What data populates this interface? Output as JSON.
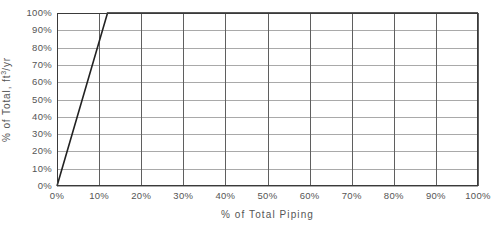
{
  "chart_data": {
    "type": "line",
    "title": "",
    "xlabel": "% of Total Piping",
    "ylabel_prefix": "% of Total, ft",
    "ylabel_superscript": "3",
    "ylabel_suffix": "/yr",
    "ylabel_plain": "% of Total, ft3/yr",
    "xlim": [
      0,
      100
    ],
    "ylim": [
      0,
      100
    ],
    "grid": true,
    "legend": "none",
    "x_tick_labels": [
      "0%",
      "10%",
      "20%",
      "30%",
      "40%",
      "50%",
      "60%",
      "70%",
      "80%",
      "90%",
      "100%"
    ],
    "x_tick_values": [
      0,
      10,
      20,
      30,
      40,
      50,
      60,
      70,
      80,
      90,
      100
    ],
    "y_tick_labels": [
      "0%",
      "10%",
      "20%",
      "30%",
      "40%",
      "50%",
      "60%",
      "70%",
      "80%",
      "90%",
      "100%"
    ],
    "y_tick_values": [
      0,
      10,
      20,
      30,
      40,
      50,
      60,
      70,
      80,
      90,
      100
    ],
    "series": [
      {
        "name": "Cumulative % of Total Volume",
        "x": [
          0,
          12,
          100
        ],
        "values": [
          0,
          100,
          100
        ],
        "color": "#222222",
        "line_width": 1.6
      }
    ],
    "colors": {
      "line": "#222222",
      "h_gridline": "#a9a9a9",
      "v_gridline": "#5f5f5f",
      "frame": "#3a3a3a",
      "text": "#555555",
      "background": "#ffffff"
    }
  }
}
